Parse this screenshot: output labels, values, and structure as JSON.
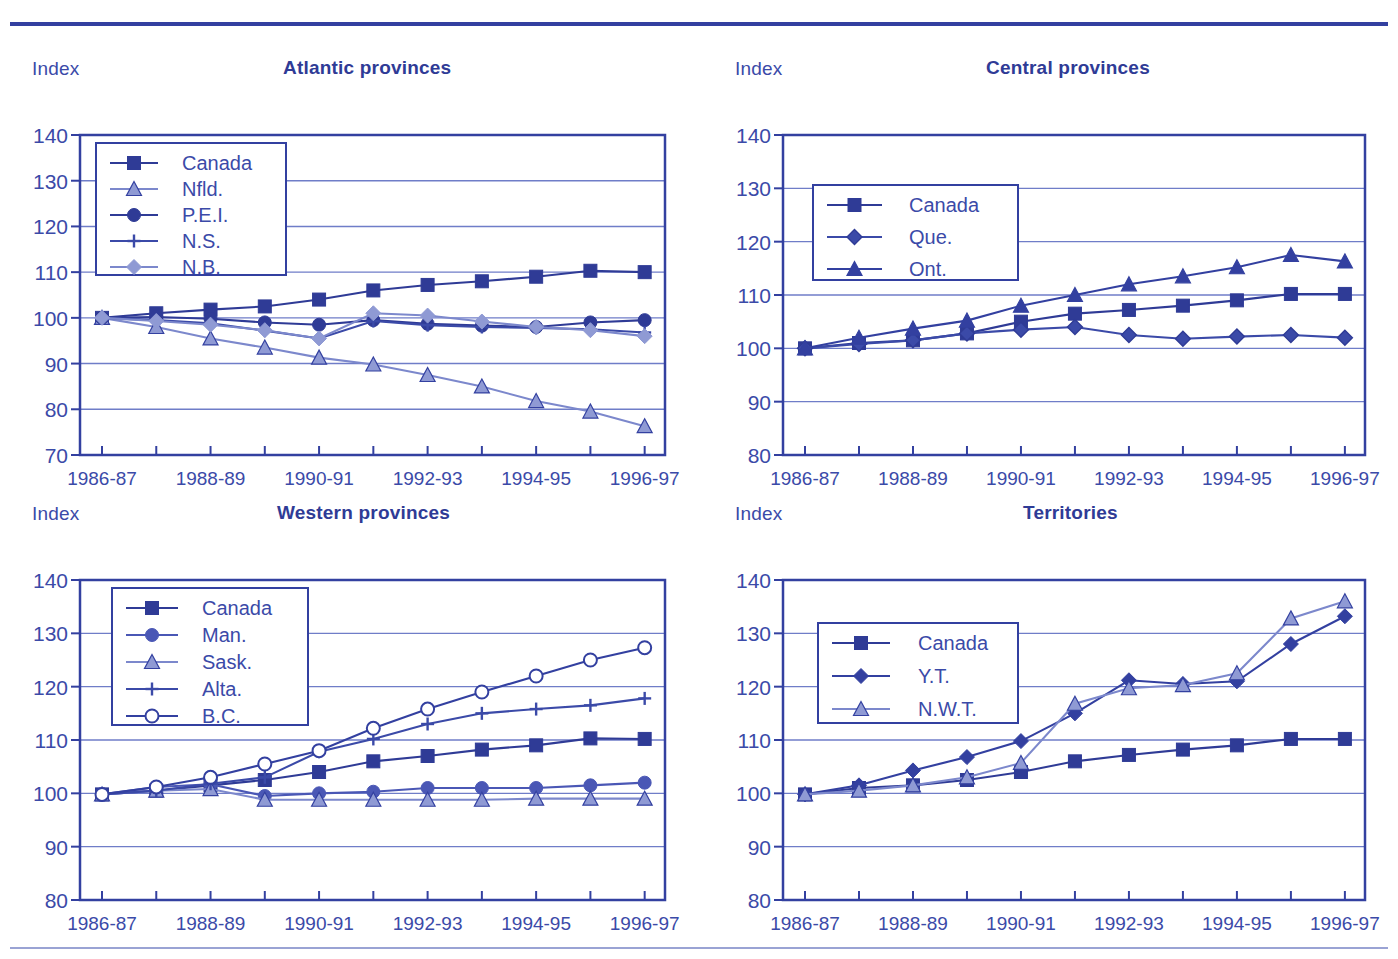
{
  "page": {
    "background": "#ffffff",
    "accent_dark": "#2f3b96",
    "accent_mid": "#3b4aa8",
    "accent_light": "#8f9ad4",
    "grid_color": "#6f7dc8"
  },
  "axis_name_label": "Index",
  "x_categories": [
    "1986-87",
    "1987-88",
    "1988-89",
    "1989-90",
    "1990-91",
    "1991-92",
    "1992-93",
    "1993-94",
    "1994-95",
    "1995-96",
    "1996-97"
  ],
  "x_tick_labels": [
    "1986-87",
    "1988-89",
    "1990-91",
    "1992-93",
    "1994-95",
    "1996-97"
  ],
  "charts": [
    {
      "id": "atlantic",
      "title": "Atlantic provinces",
      "type": "line",
      "ylabel": "Index",
      "xlabel": "",
      "ylim": [
        70,
        140
      ],
      "yticks": [
        70,
        80,
        90,
        100,
        110,
        120,
        130,
        140
      ],
      "grid": true,
      "legend_position": "top-left",
      "categories": [
        "1986-87",
        "1987-88",
        "1988-89",
        "1989-90",
        "1990-91",
        "1991-92",
        "1992-93",
        "1993-94",
        "1994-95",
        "1995-96",
        "1996-97"
      ],
      "series": [
        {
          "name": "Canada",
          "marker": "square",
          "color": "#2f3b96",
          "values": [
            100.0,
            101.0,
            101.8,
            102.5,
            104.0,
            106.0,
            107.2,
            108.0,
            109.0,
            110.3,
            110.0
          ]
        },
        {
          "name": "Nfld.",
          "marker": "triangle",
          "color": "#8f9ad4",
          "values": [
            100.0,
            98.0,
            95.5,
            93.5,
            91.3,
            89.8,
            87.5,
            85.0,
            81.8,
            79.5,
            76.3
          ]
        },
        {
          "name": "P.E.I.",
          "marker": "circle",
          "color": "#2f3b96",
          "values": [
            100.0,
            100.2,
            99.8,
            99.0,
            98.5,
            99.5,
            98.7,
            98.3,
            98.0,
            99.0,
            99.5
          ]
        },
        {
          "name": "N.S.",
          "marker": "plus",
          "color": "#3b4aa8",
          "values": [
            100.0,
            99.5,
            98.8,
            97.2,
            95.5,
            99.3,
            98.4,
            98.0,
            97.8,
            97.5,
            96.8
          ]
        },
        {
          "name": "N.B.",
          "marker": "diamond",
          "color": "#8f9ad4",
          "values": [
            100.0,
            99.3,
            98.5,
            97.3,
            95.5,
            101.0,
            100.5,
            99.2,
            98.0,
            97.3,
            96.0
          ]
        }
      ]
    },
    {
      "id": "central",
      "title": "Central provinces",
      "type": "line",
      "ylabel": "Index",
      "xlabel": "",
      "ylim": [
        80,
        140
      ],
      "yticks": [
        80,
        90,
        100,
        110,
        120,
        130,
        140
      ],
      "grid": true,
      "legend_position": "top-left",
      "categories": [
        "1986-87",
        "1987-88",
        "1988-89",
        "1989-90",
        "1990-91",
        "1991-92",
        "1992-93",
        "1993-94",
        "1994-95",
        "1995-96",
        "1996-97"
      ],
      "series": [
        {
          "name": "Canada",
          "marker": "square",
          "color": "#2f3b96",
          "values": [
            100.0,
            101.0,
            101.5,
            102.8,
            105.0,
            106.5,
            107.2,
            108.0,
            109.0,
            110.2,
            110.2
          ]
        },
        {
          "name": "Que.",
          "marker": "diamond-open",
          "color": "#3b4aa8",
          "values": [
            100.0,
            100.8,
            101.5,
            102.8,
            103.5,
            104.0,
            102.5,
            101.8,
            102.2,
            102.5,
            102.0
          ]
        },
        {
          "name": "Ont.",
          "marker": "triangle",
          "color": "#3340a0",
          "values": [
            100.0,
            102.0,
            103.7,
            105.2,
            108.0,
            110.0,
            112.0,
            113.5,
            115.2,
            117.5,
            116.3
          ]
        }
      ]
    },
    {
      "id": "western",
      "title": "Western provinces",
      "type": "line",
      "ylabel": "Index",
      "xlabel": "",
      "ylim": [
        80,
        140
      ],
      "yticks": [
        80,
        90,
        100,
        110,
        120,
        130,
        140
      ],
      "grid": true,
      "legend_position": "top-left",
      "categories": [
        "1986-87",
        "1987-88",
        "1988-89",
        "1989-90",
        "1990-91",
        "1991-92",
        "1992-93",
        "1993-94",
        "1994-95",
        "1995-96",
        "1996-97"
      ],
      "series": [
        {
          "name": "Canada",
          "marker": "square",
          "color": "#2f3b96",
          "values": [
            99.8,
            100.5,
            101.5,
            102.5,
            104.0,
            106.0,
            107.0,
            108.2,
            109.0,
            110.3,
            110.2
          ]
        },
        {
          "name": "Man.",
          "marker": "circle",
          "color": "#4a57b5",
          "values": [
            99.8,
            101.2,
            101.7,
            99.5,
            100.0,
            100.3,
            101.0,
            101.0,
            101.0,
            101.5,
            102.0
          ]
        },
        {
          "name": "Sask.",
          "marker": "triangle",
          "color": "#8f9ad4",
          "values": [
            99.8,
            100.5,
            100.8,
            98.8,
            98.8,
            98.8,
            98.8,
            98.8,
            99.0,
            99.0,
            99.0
          ]
        },
        {
          "name": "Alta.",
          "marker": "plus",
          "color": "#3b4aa8",
          "values": [
            99.8,
            100.5,
            101.8,
            103.0,
            107.8,
            110.2,
            113.0,
            115.0,
            115.8,
            116.5,
            117.8
          ]
        },
        {
          "name": "B.C.",
          "marker": "circle-open",
          "color": "#3340a0",
          "values": [
            99.8,
            101.2,
            103.0,
            105.5,
            108.0,
            112.2,
            115.8,
            119.0,
            122.0,
            125.0,
            127.3
          ]
        }
      ]
    },
    {
      "id": "territories",
      "title": "Territories",
      "type": "line",
      "ylabel": "Index",
      "xlabel": "",
      "ylim": [
        80,
        140
      ],
      "yticks": [
        80,
        90,
        100,
        110,
        120,
        130,
        140
      ],
      "grid": true,
      "legend_position": "top-left",
      "categories": [
        "1986-87",
        "1987-88",
        "1988-89",
        "1989-90",
        "1990-91",
        "1991-92",
        "1992-93",
        "1993-94",
        "1994-95",
        "1995-96",
        "1996-97"
      ],
      "series": [
        {
          "name": "Canada",
          "marker": "square",
          "color": "#2f3b96",
          "values": [
            99.8,
            101.0,
            101.5,
            102.5,
            104.0,
            106.0,
            107.2,
            108.2,
            109.0,
            110.2,
            110.2
          ]
        },
        {
          "name": "Y.T.",
          "marker": "diamond",
          "color": "#3340a0",
          "values": [
            99.8,
            101.5,
            104.3,
            106.8,
            109.8,
            115.0,
            121.2,
            120.5,
            121.0,
            128.0,
            133.2
          ]
        },
        {
          "name": "N.W.T.",
          "marker": "triangle",
          "color": "#8f9ad4",
          "values": [
            99.8,
            100.5,
            101.5,
            103.0,
            105.7,
            116.8,
            119.7,
            120.3,
            122.5,
            132.8,
            136.0
          ]
        }
      ]
    }
  ]
}
